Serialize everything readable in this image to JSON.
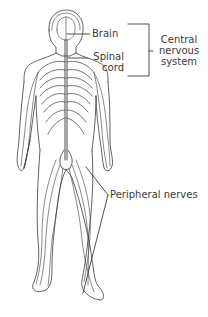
{
  "diagram": {
    "colors": {
      "background": "#ffffff",
      "line": "#3a3a3a",
      "text": "#3a3a3a"
    },
    "labels": {
      "brain": "Brain",
      "spinal_cord_line1": "Spinal",
      "spinal_cord_line2": "cord",
      "cns_line1": "Central",
      "cns_line2": "nervous",
      "cns_line3": "system",
      "peripheral": "Peripheral nerves"
    },
    "groups": [
      {
        "name": "Central nervous system",
        "members": [
          "Brain",
          "Spinal cord"
        ]
      },
      {
        "name": "Peripheral nerves",
        "members": []
      }
    ]
  }
}
